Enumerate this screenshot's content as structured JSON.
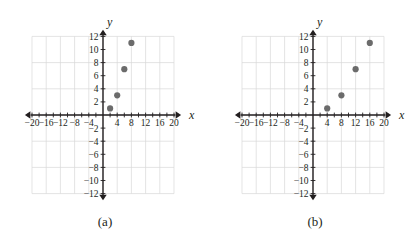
{
  "figure": {
    "panels": [
      {
        "caption": "(a)",
        "chart_data": {
          "type": "scatter",
          "title": "",
          "xlabel": "x",
          "ylabel": "y",
          "x": [
            2,
            4,
            6,
            8
          ],
          "y": [
            1,
            3,
            7,
            11
          ],
          "points": [
            {
              "x": 2,
              "y": 1
            },
            {
              "x": 4,
              "y": 3
            },
            {
              "x": 6,
              "y": 7
            },
            {
              "x": 8,
              "y": 11
            }
          ],
          "xlim": [
            -22,
            22
          ],
          "ylim": [
            -13,
            13
          ],
          "xticks": [
            -20,
            -16,
            -12,
            -8,
            -4,
            4,
            8,
            12,
            16,
            20
          ],
          "yticks": [
            12,
            10,
            8,
            6,
            4,
            2,
            -2,
            -4,
            -6,
            -8,
            -10,
            -12
          ],
          "xtick_labels": [
            "−20",
            "−16",
            "−12",
            "−8",
            "−4",
            "4",
            "8",
            "12",
            "16",
            "20"
          ],
          "ytick_labels": [
            "12",
            "10",
            "8",
            "6",
            "4",
            "2",
            "−2",
            "−4",
            "−6",
            "−8",
            "−10",
            "−12"
          ],
          "minor_tick_step": 2,
          "grid": true,
          "grid_step": 4,
          "grid_x_range": [
            -20,
            20
          ],
          "grid_y_range": [
            -12,
            12
          ],
          "legend": "none",
          "point_color": "#6b6b6b"
        }
      },
      {
        "caption": "(b)",
        "chart_data": {
          "type": "scatter",
          "title": "",
          "xlabel": "x",
          "ylabel": "y",
          "x": [
            4,
            8,
            12,
            16
          ],
          "y": [
            1,
            3,
            7,
            11
          ],
          "points": [
            {
              "x": 4,
              "y": 1
            },
            {
              "x": 8,
              "y": 3
            },
            {
              "x": 12,
              "y": 7
            },
            {
              "x": 16,
              "y": 11
            }
          ],
          "xlim": [
            -22,
            22
          ],
          "ylim": [
            -13,
            13
          ],
          "xticks": [
            -20,
            -16,
            -12,
            -8,
            -4,
            4,
            8,
            12,
            16,
            20
          ],
          "yticks": [
            12,
            10,
            8,
            6,
            4,
            2,
            -2,
            -4,
            -6,
            -8,
            -10,
            -12
          ],
          "xtick_labels": [
            "−20",
            "−16",
            "−12",
            "−8",
            "−4",
            "4",
            "8",
            "12",
            "16",
            "20"
          ],
          "ytick_labels": [
            "12",
            "10",
            "8",
            "6",
            "4",
            "2",
            "−2",
            "−4",
            "−6",
            "−8",
            "−10",
            "−12"
          ],
          "minor_tick_step": 2,
          "grid": true,
          "grid_step": 4,
          "grid_x_range": [
            -20,
            20
          ],
          "grid_y_range": [
            -12,
            12
          ],
          "legend": "none",
          "point_color": "#6b6b6b"
        }
      }
    ],
    "colors": {
      "axis": "#231f20",
      "grid": "#d9d9d9",
      "point": "#6b6b6b",
      "text": "#231f20",
      "background": "#ffffff"
    }
  }
}
